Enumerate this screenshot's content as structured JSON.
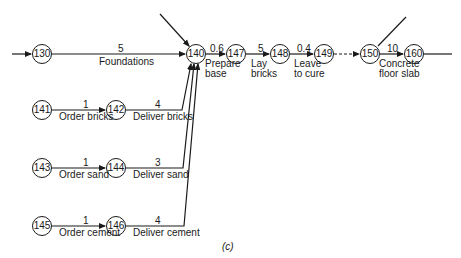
{
  "diagram": {
    "caption": "(c)",
    "nodes": [
      {
        "id": "130",
        "x": 42,
        "y": 54
      },
      {
        "id": "140",
        "x": 196,
        "y": 54
      },
      {
        "id": "147",
        "x": 236,
        "y": 54
      },
      {
        "id": "148",
        "x": 280,
        "y": 54
      },
      {
        "id": "149",
        "x": 324,
        "y": 54
      },
      {
        "id": "150",
        "x": 370,
        "y": 54
      },
      {
        "id": "160",
        "x": 414,
        "y": 54
      },
      {
        "id": "141",
        "x": 42,
        "y": 110
      },
      {
        "id": "142",
        "x": 116,
        "y": 110
      },
      {
        "id": "143",
        "x": 42,
        "y": 168
      },
      {
        "id": "144",
        "x": 116,
        "y": 168
      },
      {
        "id": "145",
        "x": 42,
        "y": 226
      },
      {
        "id": "146",
        "x": 116,
        "y": 226
      }
    ],
    "activities": [
      {
        "from": "130",
        "to": "140",
        "duration": "5",
        "label": "Foundations"
      },
      {
        "from": "141",
        "to": "142",
        "duration": "1",
        "label": "Order bricks"
      },
      {
        "from": "142",
        "to": "140",
        "duration": "4",
        "label": "Deliver bricks"
      },
      {
        "from": "143",
        "to": "144",
        "duration": "1",
        "label": "Order sand"
      },
      {
        "from": "144",
        "to": "140",
        "duration": "3",
        "label": "Deliver sand"
      },
      {
        "from": "145",
        "to": "146",
        "duration": "1",
        "label": "Order cement"
      },
      {
        "from": "146",
        "to": "140",
        "duration": "4",
        "label": "Deliver cement"
      },
      {
        "from": "140",
        "to": "147",
        "duration": "0.6",
        "label_line1": "Prepare",
        "label_line2": "base"
      },
      {
        "from": "147",
        "to": "148",
        "duration": "5",
        "label_line1": "Lay",
        "label_line2": "bricks"
      },
      {
        "from": "148",
        "to": "149",
        "duration": "0.4",
        "label_line1": "Leave",
        "label_line2": "to cure"
      },
      {
        "from": "149",
        "to": "150",
        "duration": "",
        "label": "dummy (dashed)"
      },
      {
        "from": "150",
        "to": "160",
        "duration": "10",
        "label_line1": "Concrete",
        "label_line2": "floor slab"
      }
    ]
  }
}
